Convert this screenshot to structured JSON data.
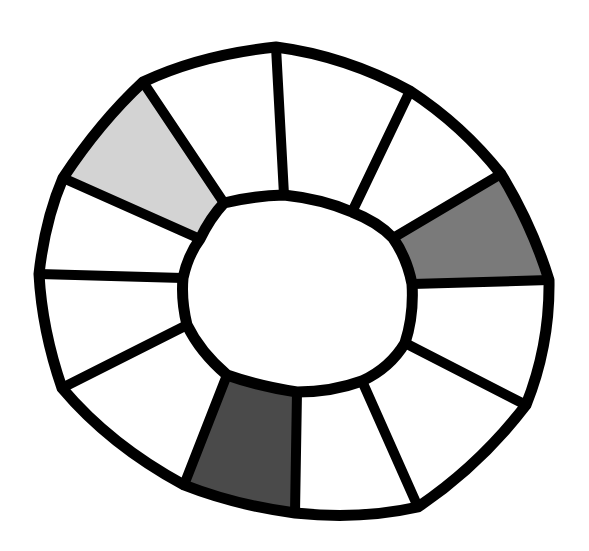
{
  "diagram": {
    "segment_count": 12,
    "segments": [
      {
        "index": 1,
        "position": "top-right",
        "fill": "#ffffff",
        "shade": "white"
      },
      {
        "index": 2,
        "position": "upper-right",
        "fill": "#ffffff",
        "shade": "white"
      },
      {
        "index": 3,
        "position": "right-upper",
        "fill": "#7a7a7a",
        "shade": "medium-gray"
      },
      {
        "index": 4,
        "position": "right-lower",
        "fill": "#ffffff",
        "shade": "white"
      },
      {
        "index": 5,
        "position": "lower-right",
        "fill": "#ffffff",
        "shade": "white"
      },
      {
        "index": 6,
        "position": "bottom-right",
        "fill": "#ffffff",
        "shade": "white"
      },
      {
        "index": 7,
        "position": "bottom-left",
        "fill": "#4a4a4a",
        "shade": "dark-gray"
      },
      {
        "index": 8,
        "position": "lower-left",
        "fill": "#ffffff",
        "shade": "white"
      },
      {
        "index": 9,
        "position": "left-lower",
        "fill": "#ffffff",
        "shade": "white"
      },
      {
        "index": 10,
        "position": "left-upper",
        "fill": "#ffffff",
        "shade": "white"
      },
      {
        "index": 11,
        "position": "upper-left",
        "fill": "#d3d3d3",
        "shade": "light-gray"
      },
      {
        "index": 12,
        "position": "top-left",
        "fill": "#ffffff",
        "shade": "white"
      }
    ],
    "colors": {
      "outline": "#000000",
      "background": "#ffffff",
      "center": "#ffffff"
    }
  }
}
